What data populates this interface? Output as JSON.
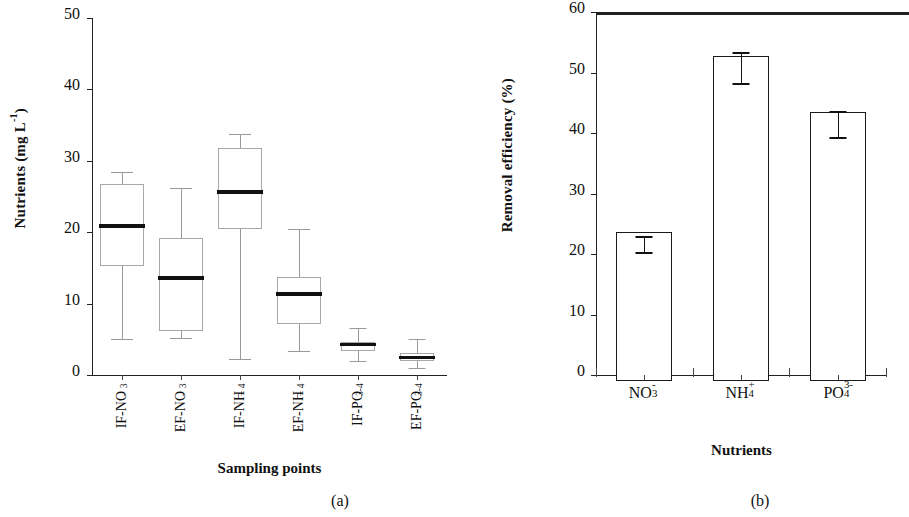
{
  "figure": {
    "panel_a_caption": "(a)",
    "panel_b_caption": "(b)"
  },
  "panel_a": {
    "ylabel_main": "Nutrients (mg L",
    "ylabel_sup": "-1",
    "ylabel_close": ")",
    "xlabel": "Sampling points",
    "yticks": [
      "0",
      "10",
      "20",
      "30",
      "40",
      "50"
    ]
  },
  "panel_b": {
    "ylabel": "Removal efficiency (%)",
    "xlabel": "Nutrients",
    "yticks": [
      "0",
      "10",
      "20",
      "30",
      "40",
      "50",
      "60"
    ]
  },
  "chart_data": [
    {
      "type": "box",
      "panel": "(a)",
      "title": "",
      "xlabel": "Sampling points",
      "ylabel": "Nutrients (mg L-1)",
      "ylim": [
        0,
        50
      ],
      "ytick_values": [
        0,
        10,
        20,
        30,
        40,
        50
      ],
      "grid": false,
      "legend": "none",
      "categories": [
        "IF-NO3-",
        "EF-NO3-",
        "IF-NH4+",
        "EF-NH4+",
        "IF-PO43-",
        "EF-PO43-"
      ],
      "category_labels_base": [
        "IF-NO",
        "EF-NO",
        "IF-NH",
        "EF-NH",
        "IF-PO",
        "EF-PO"
      ],
      "category_labels_sub": [
        "3",
        "3",
        "4",
        "4",
        "4",
        "4"
      ],
      "category_labels_sup": [
        "-",
        "-",
        "+",
        "+",
        "3-",
        "3-"
      ],
      "boxes": [
        {
          "name": "IF-NO3-",
          "whisker_low": 5.0,
          "q1": 15.3,
          "median": 20.8,
          "q3": 26.8,
          "whisker_high": 28.5
        },
        {
          "name": "EF-NO3-",
          "whisker_low": 5.2,
          "q1": 6.2,
          "median": 13.6,
          "q3": 19.2,
          "whisker_high": 26.2
        },
        {
          "name": "IF-NH4+",
          "whisker_low": 2.2,
          "q1": 20.4,
          "median": 25.7,
          "q3": 31.8,
          "whisker_high": 33.8
        },
        {
          "name": "EF-NH4+",
          "whisker_low": 3.3,
          "q1": 7.1,
          "median": 11.3,
          "q3": 13.7,
          "whisker_high": 20.4
        },
        {
          "name": "IF-PO43-",
          "whisker_low": 2.0,
          "q1": 3.3,
          "median": 4.2,
          "q3": 4.6,
          "whisker_high": 6.6
        },
        {
          "name": "EF-PO43-",
          "whisker_low": 1.0,
          "q1": 1.9,
          "median": 2.4,
          "q3": 3.1,
          "whisker_high": 5.1
        }
      ]
    },
    {
      "type": "bar",
      "panel": "(b)",
      "title": "",
      "xlabel": "Nutrients",
      "ylabel": "Removal efficiency (%)",
      "ylim": [
        0,
        60
      ],
      "ytick_values": [
        0,
        10,
        20,
        30,
        40,
        50,
        60
      ],
      "grid": false,
      "legend": "none",
      "categories": [
        "NO3-",
        "NH4+",
        "PO43-"
      ],
      "category_labels_base": [
        "NO",
        "NH",
        "PO"
      ],
      "category_labels_sub": [
        "3",
        "4",
        "4"
      ],
      "category_labels_sup": [
        "-",
        "+",
        "3-"
      ],
      "values": [
        22.7,
        51.8,
        42.5
      ],
      "errors": [
        1.3,
        2.5,
        2.2
      ]
    }
  ]
}
